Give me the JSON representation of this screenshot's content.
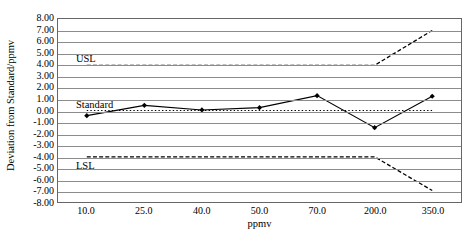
{
  "chart_data": {
    "type": "line",
    "title": "",
    "xlabel": "ppmv",
    "ylabel": "Deviation from Standard/ppmv",
    "categories": [
      "10.0",
      "25.0",
      "40.0",
      "50.0",
      "70.0",
      "200.0",
      "350.0"
    ],
    "x_positions": [
      10.0,
      25.0,
      40.0,
      50.0,
      70.0,
      200.0,
      350.0
    ],
    "ylim": [
      -8.0,
      8.0
    ],
    "ytick_labels": [
      "8.00",
      "7.00",
      "6.00",
      "5.00",
      "4.00",
      "3.00",
      "2.00",
      "1.00",
      "0.00",
      "-1.00",
      "-2.00",
      "-3.00",
      "-4.00",
      "-5.00",
      "-6.00",
      "-7.00",
      "-8.00"
    ],
    "ytick_values": [
      8.0,
      7.0,
      6.0,
      5.0,
      4.0,
      3.0,
      2.0,
      1.0,
      0.0,
      -1.0,
      -2.0,
      -3.0,
      -4.0,
      -5.0,
      -6.0,
      -7.0,
      -8.0
    ],
    "grid": true,
    "legend_position": "inline-annotations",
    "series": [
      {
        "name": "Deviation",
        "style": "solid-line-with-markers",
        "marker": "diamond",
        "color": "#000000",
        "values": [
          -0.45,
          0.45,
          0.05,
          0.25,
          1.3,
          -1.5,
          1.25
        ]
      },
      {
        "name": "USL",
        "style": "dashed",
        "color": "#000000",
        "values": [
          3.95,
          3.95,
          3.95,
          3.95,
          3.95,
          3.95,
          7.0
        ]
      },
      {
        "name": "Standard",
        "style": "dotted",
        "color": "#000000",
        "values": [
          0.0,
          0.0,
          0.0,
          0.0,
          0.0,
          0.0,
          0.0
        ]
      },
      {
        "name": "LSL",
        "style": "dashed",
        "color": "#000000",
        "values": [
          -4.05,
          -4.05,
          -4.05,
          -4.05,
          -4.05,
          -4.05,
          -7.0
        ]
      }
    ],
    "annotations": [
      {
        "text": "USL",
        "x_value": 10.0,
        "y_value": 4.55
      },
      {
        "text": "Standard",
        "x_value": 10.0,
        "y_value": 0.6
      },
      {
        "text": "LSL",
        "x_value": 10.0,
        "y_value": -4.75
      }
    ]
  }
}
